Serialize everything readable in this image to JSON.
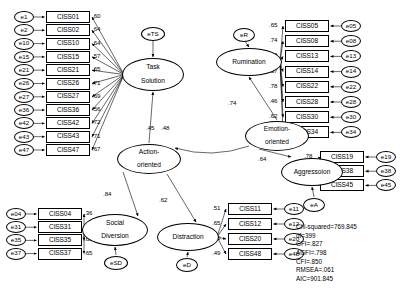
{
  "diagram": {
    "type": "sem-path-diagram"
  },
  "latents": [
    {
      "id": "task-solution",
      "label": "Task\nSolution",
      "x": 122,
      "y": 58,
      "w": 62,
      "h": 33
    },
    {
      "id": "rumination",
      "label": "Rumination",
      "x": 216,
      "y": 48,
      "w": 66,
      "h": 28
    },
    {
      "id": "emotion-oriented",
      "label": "Emotion-\noriented",
      "x": 245,
      "y": 121,
      "w": 64,
      "h": 30
    },
    {
      "id": "action-oriented",
      "label": "Action-\noriented",
      "x": 117,
      "y": 144,
      "w": 64,
      "h": 30
    },
    {
      "id": "aggression",
      "label": "Aggressoion",
      "x": 281,
      "y": 158,
      "w": 62,
      "h": 28
    },
    {
      "id": "social-diversion",
      "label": "Social\nDiversion",
      "x": 82,
      "y": 214,
      "w": 66,
      "h": 32
    },
    {
      "id": "distraction",
      "label": "Distraction",
      "x": 157,
      "y": 223,
      "w": 62,
      "h": 28
    }
  ],
  "disturbances": [
    {
      "id": "eTS",
      "label": "eTS",
      "x": 141,
      "y": 27,
      "w": 24,
      "h": 14
    },
    {
      "id": "eR",
      "label": "eR",
      "x": 233,
      "y": 28,
      "w": 22,
      "h": 14
    },
    {
      "id": "eSD",
      "label": "eSD",
      "x": 104,
      "y": 256,
      "w": 24,
      "h": 14
    },
    {
      "id": "eD",
      "label": "eD",
      "x": 176,
      "y": 258,
      "w": 22,
      "h": 14
    },
    {
      "id": "eA",
      "label": "eA",
      "x": 303,
      "y": 198,
      "w": 22,
      "h": 14
    }
  ],
  "indicators": {
    "task_solution": [
      {
        "err": "e1",
        "item": "CISS01",
        "loading": ".60"
      },
      {
        "err": "e2",
        "item": "CISS02",
        "loading": ".64"
      },
      {
        "err": "e10",
        "item": "CISS10",
        "loading": ".64"
      },
      {
        "err": "e15",
        "item": "CISS15",
        "loading": ".57"
      },
      {
        "err": "e21",
        "item": "CISS21",
        "loading": ".65"
      },
      {
        "err": "e26",
        "item": "CISS26",
        "loading": ".71"
      },
      {
        "err": "e27",
        "item": "CISS27",
        "loading": ".69"
      },
      {
        "err": "e36",
        "item": "CISS36",
        "loading": ".56"
      },
      {
        "err": "e42",
        "item": "CISS42",
        "loading": ".72"
      },
      {
        "err": "e43",
        "item": "CISS43",
        "loading": ".71"
      },
      {
        "err": "e47",
        "item": "CISS47",
        "loading": ".67"
      }
    ],
    "rumination": [
      {
        "err": "e05",
        "item": "CISS05",
        "loading": ".65"
      },
      {
        "err": "e08",
        "item": "CISS08",
        "loading": ".74"
      },
      {
        "err": "e13",
        "item": "CISS13",
        "loading": ".68"
      },
      {
        "err": "e14",
        "item": "CISS14",
        "loading": ".57"
      },
      {
        "err": "e22",
        "item": "CISS22",
        "loading": ".78"
      },
      {
        "err": "e28",
        "item": "CISS28",
        "loading": ".46"
      },
      {
        "err": "e30",
        "item": "CISS30",
        "loading": ".62"
      },
      {
        "err": "e34",
        "item": "CISS34",
        "loading": ".49"
      }
    ],
    "aggression": [
      {
        "err": "e19",
        "item": "CISS19",
        "loading": ".78"
      },
      {
        "err": "e38",
        "item": "CISS38",
        "loading": ".67"
      },
      {
        "err": "e45",
        "item": "CISS45",
        "loading": ".67"
      }
    ],
    "social_diversion": [
      {
        "err": "e04",
        "item": "CISS04",
        "loading": ".36"
      },
      {
        "err": "e31",
        "item": "CISS31",
        "loading": ".42"
      },
      {
        "err": "e35",
        "item": "CISS35",
        "loading": ".65"
      },
      {
        "err": "e37",
        "item": "CISS37",
        "loading": ".65"
      }
    ],
    "distraction": [
      {
        "err": "e11",
        "item": "CISS11",
        "loading": ".51"
      },
      {
        "err": "e12",
        "item": "CISS12",
        "loading": ".65"
      },
      {
        "err": "e20",
        "item": "CISS20",
        "loading": ".65"
      },
      {
        "err": "e48",
        "item": "CISS48",
        "loading": ".49"
      }
    ]
  },
  "structural_paths": [
    {
      "id": "emotion-to-rumination",
      "label": ".74",
      "x": 228,
      "y": 99
    },
    {
      "id": "action-to-task-a",
      "label": ".45",
      "x": 146,
      "y": 124
    },
    {
      "id": "action-to-task-b",
      "label": ".48",
      "x": 161,
      "y": 124
    },
    {
      "id": "action-to-social",
      "label": ".84",
      "x": 103,
      "y": 190
    },
    {
      "id": "action-to-distraction",
      "label": ".62",
      "x": 159,
      "y": 196
    },
    {
      "id": "emotion-to-aggression",
      "label": ".64",
      "x": 258,
      "y": 155
    }
  ],
  "fit_statistics": [
    "Chi-squared=769.845",
    "df=399",
    "GFI=.827",
    "AGFI=.798",
    "CFI=.850",
    "RMSEA=.061",
    "AIC=901.845"
  ],
  "fit_position": {
    "x": 296,
    "y": 223
  }
}
